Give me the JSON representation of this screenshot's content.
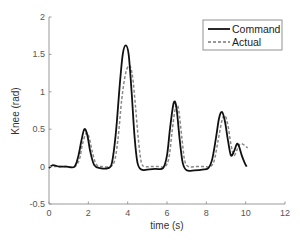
{
  "chart_data": {
    "type": "line",
    "title": "",
    "xlabel": "time (s)",
    "ylabel": "Knee (rad)",
    "xlim": [
      0,
      12
    ],
    "ylim": [
      -0.5,
      2
    ],
    "xticks": [
      0,
      2,
      4,
      6,
      8,
      10,
      12
    ],
    "xtick_labels": [
      "0",
      "2",
      "4",
      "6",
      "8",
      "10",
      "12"
    ],
    "yticks": [
      -0.5,
      0,
      0.5,
      1,
      1.5,
      2
    ],
    "ytick_labels": [
      "-0.5",
      "0",
      "0.5",
      "1",
      "1.5",
      "2"
    ],
    "grid": false,
    "legend": {
      "placement": "top-right",
      "entries": [
        "Command",
        "Actual"
      ]
    },
    "series": [
      {
        "name": "Command",
        "style": "solid",
        "color": "#111111",
        "x": [
          0,
          0.2,
          0.5,
          0.9,
          1.3,
          1.5,
          1.65,
          1.8,
          1.95,
          2.1,
          2.3,
          2.6,
          3.0,
          3.2,
          3.4,
          3.6,
          3.75,
          3.9,
          4.05,
          4.2,
          4.35,
          4.5,
          4.7,
          5.0,
          5.4,
          5.8,
          6.0,
          6.15,
          6.3,
          6.4,
          6.5,
          6.65,
          6.8,
          7.0,
          7.4,
          7.8,
          8.1,
          8.3,
          8.5,
          8.65,
          8.8,
          8.95,
          9.1,
          9.25,
          9.4,
          9.55,
          9.65,
          9.8,
          9.95,
          10.05
        ],
        "y": [
          -0.02,
          0.02,
          0.0,
          0.0,
          0.0,
          0.15,
          0.35,
          0.5,
          0.42,
          0.2,
          0.02,
          -0.02,
          -0.02,
          0.05,
          0.45,
          1.1,
          1.5,
          1.62,
          1.5,
          1.0,
          0.4,
          0.05,
          -0.04,
          -0.04,
          -0.03,
          -0.02,
          0.15,
          0.5,
          0.8,
          0.87,
          0.75,
          0.35,
          0.05,
          -0.05,
          -0.05,
          -0.04,
          -0.02,
          0.1,
          0.4,
          0.65,
          0.73,
          0.6,
          0.35,
          0.15,
          0.2,
          0.3,
          0.28,
          0.15,
          0.05,
          0.0
        ]
      },
      {
        "name": "Actual",
        "style": "dashed",
        "color": "#888888",
        "x": [
          0,
          0.2,
          0.5,
          0.9,
          1.3,
          1.55,
          1.7,
          1.9,
          2.05,
          2.2,
          2.4,
          2.7,
          3.0,
          3.3,
          3.5,
          3.7,
          3.9,
          4.1,
          4.25,
          4.4,
          4.55,
          4.7,
          4.9,
          5.2,
          5.6,
          5.9,
          6.1,
          6.25,
          6.4,
          6.5,
          6.6,
          6.75,
          6.9,
          7.1,
          7.5,
          7.9,
          8.2,
          8.4,
          8.6,
          8.8,
          8.95,
          9.1,
          9.25,
          9.4,
          9.55,
          9.7,
          9.85,
          10.0,
          10.1
        ],
        "y": [
          0.0,
          0.0,
          0.0,
          0.0,
          0.0,
          0.1,
          0.3,
          0.45,
          0.38,
          0.2,
          0.03,
          0.0,
          0.0,
          0.05,
          0.35,
          0.9,
          1.25,
          1.35,
          1.2,
          0.8,
          0.35,
          0.05,
          0.0,
          0.0,
          0.0,
          0.0,
          0.12,
          0.45,
          0.75,
          0.83,
          0.75,
          0.4,
          0.08,
          0.0,
          0.0,
          0.0,
          0.0,
          0.08,
          0.35,
          0.62,
          0.68,
          0.55,
          0.3,
          0.15,
          0.22,
          0.3,
          0.3,
          0.27,
          0.25
        ]
      }
    ]
  }
}
